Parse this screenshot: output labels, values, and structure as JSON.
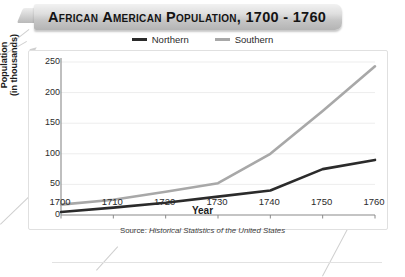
{
  "banner": {
    "title": "African American Population, 1700 - 1760"
  },
  "legend": [
    {
      "label": "Northern",
      "color": "#2b2b2b"
    },
    {
      "label": "Southern",
      "color": "#a8a8a8"
    }
  ],
  "source": {
    "prefix": "Source: ",
    "text": "Historical Statistics of the United States"
  },
  "chart_data": {
    "type": "line",
    "title": "African American Population, 1700 - 1760",
    "xlabel": "Year",
    "ylabel": "Population (in thousands)",
    "ylabel_line1": "Population",
    "ylabel_line2": "(in thousands)",
    "x": [
      1700,
      1710,
      1720,
      1730,
      1740,
      1750,
      1760
    ],
    "xticklabels": [
      "1700",
      "1710",
      "1720",
      "1730",
      "1740",
      "1750",
      "1760"
    ],
    "yticks": [
      0,
      50,
      100,
      150,
      200,
      250
    ],
    "yticklabels": [
      "0",
      "50",
      "100",
      "150",
      "200",
      "250"
    ],
    "xlim": [
      1700,
      1760
    ],
    "ylim": [
      0,
      250
    ],
    "grid": "horizontal",
    "legend_position": "top-center",
    "series": [
      {
        "name": "Northern",
        "color": "#2b2b2b",
        "width": 2.6,
        "values": [
          5,
          12,
          20,
          30,
          40,
          75,
          90
        ]
      },
      {
        "name": "Southern",
        "color": "#a8a8a8",
        "width": 2.6,
        "values": [
          17,
          25,
          38,
          52,
          100,
          170,
          243
        ]
      }
    ]
  }
}
